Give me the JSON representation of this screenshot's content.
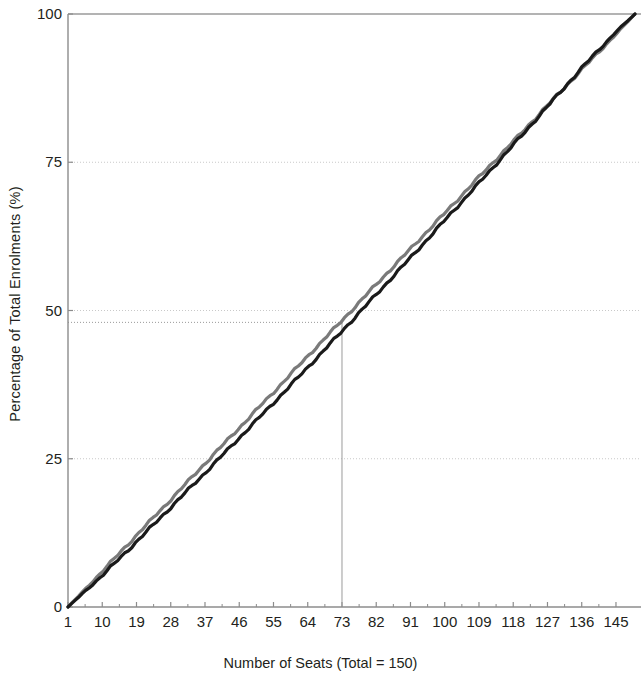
{
  "chart_data": {
    "type": "line",
    "title": "",
    "xlabel": "Number of Seats (Total = 150)",
    "ylabel": "Percentage of Total Enrolments (%)",
    "xlim": [
      1,
      150
    ],
    "ylim": [
      0,
      100
    ],
    "grid": true,
    "legend": false,
    "xticks": [
      1,
      10,
      19,
      28,
      37,
      46,
      55,
      64,
      73,
      82,
      91,
      100,
      109,
      118,
      127,
      136,
      145
    ],
    "yticks": [
      0,
      25,
      50,
      75,
      100
    ],
    "annotations": [
      {
        "name": "median-seat-reference",
        "type": "crosshair",
        "x": 73,
        "y": 48,
        "label": ""
      }
    ],
    "series": [
      {
        "name": "equality-line",
        "color": "#7a7a7a",
        "width": 3.2,
        "x": [
          1,
          10,
          19,
          28,
          37,
          46,
          55,
          64,
          73,
          82,
          91,
          100,
          109,
          118,
          127,
          136,
          145,
          150
        ],
        "values": [
          0.0,
          6.0,
          12.1,
          18.1,
          24.2,
          30.2,
          36.2,
          42.3,
          48.3,
          54.4,
          60.4,
          66.4,
          72.5,
          78.5,
          84.6,
          90.6,
          96.6,
          100.0
        ]
      },
      {
        "name": "cumulative-enrolments-line",
        "color": "#1a1a1a",
        "width": 3.2,
        "x": [
          1,
          10,
          19,
          28,
          37,
          46,
          55,
          64,
          73,
          82,
          91,
          100,
          109,
          118,
          127,
          136,
          145,
          150
        ],
        "values": [
          0.0,
          5.3,
          11.0,
          16.8,
          22.6,
          28.5,
          34.4,
          40.4,
          46.5,
          52.7,
          58.9,
          65.2,
          71.5,
          77.9,
          84.4,
          90.9,
          97.0,
          100.0
        ]
      }
    ]
  },
  "axes": {
    "y_tick_labels": [
      "100",
      "75",
      "50",
      "25",
      "0"
    ],
    "x_tick_labels": [
      "1",
      "10",
      "19",
      "28",
      "37",
      "46",
      "55",
      "64",
      "73",
      "82",
      "91",
      "100",
      "109",
      "118",
      "127",
      "136",
      "145"
    ],
    "x_title": "Number of Seats (Total = 150)",
    "y_title": "Percentage of Total Enrolments (%)"
  },
  "colors": {
    "gray_line": "#7a7a7a",
    "black_line": "#1a1a1a",
    "axis": "#8c8c8c",
    "grid": "#c9c9c9",
    "text": "#231f20",
    "background": "#ffffff"
  }
}
